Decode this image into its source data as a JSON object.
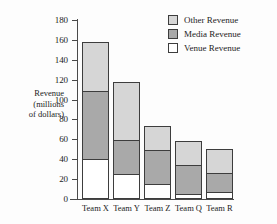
{
  "chart_data": {
    "type": "bar",
    "subtype": "stacked-bar",
    "title": "",
    "xlabel": "",
    "ylabel": "Revenue (millions of dollars)",
    "ylabel_lines": [
      "Revenue",
      "(millions",
      "of dollars)"
    ],
    "categories": [
      "Team X",
      "Team Y",
      "Team Z",
      "Team Q",
      "Team R"
    ],
    "series": [
      {
        "name": "Venue Revenue",
        "color": "#ffffff",
        "values": [
          40,
          25,
          15,
          5,
          7
        ]
      },
      {
        "name": "Media Revenue",
        "color": "#a9a9a9",
        "values": [
          70,
          35,
          35,
          30,
          20
        ]
      },
      {
        "name": "Other Revenue",
        "color": "#d6d6d6",
        "values": [
          50,
          60,
          25,
          25,
          25
        ]
      }
    ],
    "totals": [
      160,
      120,
      75,
      60,
      52
    ],
    "ylim": [
      0,
      180
    ],
    "ytick_step": 20,
    "yticks": [
      180,
      160,
      140,
      120,
      100,
      80,
      60,
      40,
      20,
      0
    ],
    "grid": false,
    "legend_position": "top-right",
    "stack_order_top_to_bottom": [
      "Other Revenue",
      "Media Revenue",
      "Venue Revenue"
    ]
  },
  "legend": {
    "items": [
      {
        "label": "Other Revenue",
        "swatch": "#d6d6d6"
      },
      {
        "label": "Media Revenue",
        "swatch": "#a9a9a9"
      },
      {
        "label": "Venue Revenue",
        "swatch": "#ffffff"
      }
    ]
  },
  "colors": {
    "other_revenue": "#d6d6d6",
    "media_revenue": "#a9a9a9",
    "venue_revenue": "#ffffff",
    "axis": "#4a4a4a",
    "outline": "#3d3d3d",
    "background": "#fdfdfd"
  }
}
